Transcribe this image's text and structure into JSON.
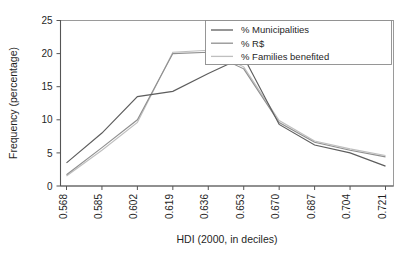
{
  "chart_data": {
    "type": "line",
    "title": "",
    "xlabel": "HDI (2000, in deciles)",
    "ylabel": "Frequency (percentage)",
    "x": [
      "0.568",
      "0.585",
      "0.602",
      "0.619",
      "0.636",
      "0.653",
      "0.670",
      "0.687",
      "0.704",
      "0.721"
    ],
    "categories": [
      "0.568",
      "0.585",
      "0.602",
      "0.619",
      "0.636",
      "0.653",
      "0.670",
      "0.687",
      "0.704",
      "0.721"
    ],
    "xtick_labels": [
      "0.568",
      "0.585",
      "0.602",
      "0.619",
      "0.636",
      "0.653",
      "0.670",
      "0.687",
      "0.704",
      "0.721"
    ],
    "ytick_labels": [
      "0",
      "5",
      "10",
      "15",
      "20",
      "25"
    ],
    "ytick_values": [
      0,
      5,
      10,
      15,
      20,
      25
    ],
    "ylim": [
      0,
      25
    ],
    "grid": false,
    "legend_position": "top-right",
    "series": [
      {
        "name": "% Municipalities",
        "color": "#5d5d5d",
        "values": [
          3.5,
          8.0,
          13.5,
          14.3,
          17.0,
          19.5,
          9.3,
          6.2,
          5.0,
          3.0
        ]
      },
      {
        "name": "% R$",
        "color": "#8f8f8f",
        "values": [
          1.7,
          5.8,
          10.0,
          20.0,
          20.2,
          17.7,
          9.6,
          6.6,
          5.4,
          4.4
        ]
      },
      {
        "name": "% Families benefited",
        "color": "#bfbfbf",
        "values": [
          1.5,
          5.4,
          9.6,
          20.2,
          20.5,
          18.0,
          9.9,
          6.8,
          5.6,
          4.6
        ]
      }
    ]
  },
  "legend": {
    "items": [
      {
        "label": "% Municipalities"
      },
      {
        "label": "% R$"
      },
      {
        "label": "% Families benefited"
      }
    ]
  },
  "axes": {
    "x_title": "HDI (2000, in deciles)",
    "y_title": "Frequency (percentage)"
  }
}
